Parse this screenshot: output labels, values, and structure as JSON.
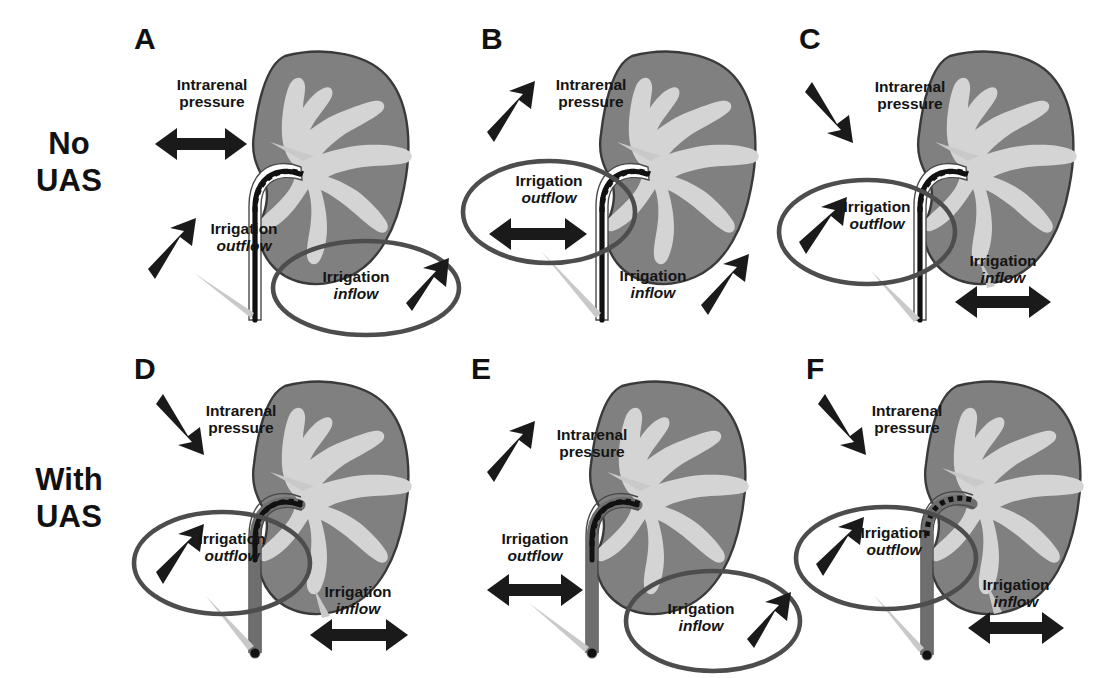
{
  "figure": {
    "type": "medical-diagram",
    "row_labels": [
      {
        "id": "no-uas",
        "line1": "No",
        "line2": "UAS"
      },
      {
        "id": "with-uas",
        "line1": "With",
        "line2": "UAS"
      }
    ],
    "label_text": {
      "intrarenal_pressure_line1": "Intrarenal",
      "intrarenal_pressure_line2": "pressure",
      "irrigation_line": "Irrigation",
      "outflow": "outflow",
      "inflow": "inflow"
    },
    "colors": {
      "kidney_cortex": "#808080",
      "kidney_collecting_system": "#d4d4d4",
      "kidney_outline": "#3a3a3a",
      "arrow": "#1a1a1a",
      "circle_highlight": "#4d4d4d",
      "scope": "#111111",
      "sheath": "#6e6e6e",
      "text": "#141414",
      "background": "#ffffff"
    },
    "panels": [
      {
        "letter": "A",
        "row": "No UAS",
        "intrarenal_pressure": {
          "arrow": "double-horizontal",
          "meaning": "neutral"
        },
        "irrigation_outflow": {
          "arrow": "up-right",
          "meaning": "increased",
          "circled": false
        },
        "irrigation_inflow": {
          "arrow": "up-right",
          "meaning": "increased",
          "circled": true
        },
        "scope": "flexible ureteroscope, no sheath"
      },
      {
        "letter": "B",
        "row": "No UAS",
        "intrarenal_pressure": {
          "arrow": "up-right",
          "meaning": "increased"
        },
        "irrigation_outflow": {
          "arrow": "double-horizontal",
          "meaning": "neutral",
          "circled": true
        },
        "irrigation_inflow": {
          "arrow": "up-right",
          "meaning": "increased",
          "circled": false
        },
        "scope": "flexible ureteroscope, no sheath"
      },
      {
        "letter": "C",
        "row": "No UAS",
        "intrarenal_pressure": {
          "arrow": "down-right",
          "meaning": "decreased"
        },
        "irrigation_outflow": {
          "arrow": "up-right",
          "meaning": "increased",
          "circled": true
        },
        "irrigation_inflow": {
          "arrow": "double-horizontal",
          "meaning": "neutral",
          "circled": false
        },
        "scope": "flexible ureteroscope, no sheath"
      },
      {
        "letter": "D",
        "row": "With UAS",
        "intrarenal_pressure": {
          "arrow": "down-right",
          "meaning": "decreased"
        },
        "irrigation_outflow": {
          "arrow": "up-right",
          "meaning": "increased",
          "circled": true
        },
        "irrigation_inflow": {
          "arrow": "double-horizontal",
          "meaning": "neutral",
          "circled": false
        },
        "scope": "flexible ureteroscope inside ureteral access sheath"
      },
      {
        "letter": "E",
        "row": "With UAS",
        "intrarenal_pressure": {
          "arrow": "up-right",
          "meaning": "increased"
        },
        "irrigation_outflow": {
          "arrow": "double-horizontal",
          "meaning": "neutral",
          "circled": false
        },
        "irrigation_inflow": {
          "arrow": "up-right",
          "meaning": "increased",
          "circled": true
        },
        "scope": "flexible ureteroscope inside ureteral access sheath"
      },
      {
        "letter": "F",
        "row": "With UAS",
        "intrarenal_pressure": {
          "arrow": "down-right",
          "meaning": "decreased"
        },
        "irrigation_outflow": {
          "arrow": "up-right",
          "meaning": "increased",
          "circled": true
        },
        "irrigation_inflow": {
          "arrow": "double-horizontal",
          "meaning": "neutral",
          "circled": false
        },
        "scope": "flexible ureteroscope inside ureteral access sheath"
      }
    ]
  }
}
